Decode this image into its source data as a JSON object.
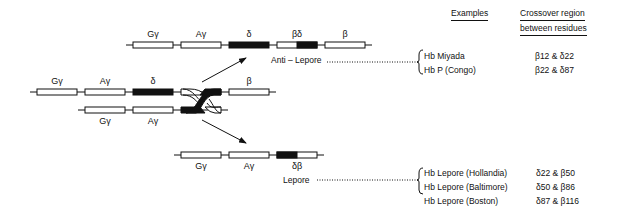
{
  "headers": {
    "examples": "Examples",
    "crossover_line1": "Crossover region",
    "crossover_line2": "between residues"
  },
  "rows": {
    "top": {
      "genes": [
        "Gγ",
        "Aγ",
        "δ",
        "βδ",
        "β"
      ],
      "label": "Anti – Lepore"
    },
    "middle_upper": {
      "genes": [
        "Gγ",
        "Aγ",
        "δ",
        "β"
      ]
    },
    "middle_lower": {
      "genes": [
        "Gγ",
        "Aγ"
      ]
    },
    "bottom": {
      "genes": [
        "Gγ",
        "Aγ",
        "δβ"
      ],
      "label": "Lepore"
    }
  },
  "anti_lepore_examples": [
    {
      "name": "Hb  Miyada",
      "region": "β12 & δ22"
    },
    {
      "name": "Hb  P  (Congo)",
      "region": "β22 & δ87"
    }
  ],
  "lepore_examples": [
    {
      "name": "Hb  Lepore  (Hollandia)",
      "region": "δ22 & β50"
    },
    {
      "name": "Hb  Lepore  (Baltimore)",
      "region": "δ50 & β86"
    },
    {
      "name": "Hb  Lepore  (Boston)",
      "region": "δ87 & β116"
    }
  ],
  "colors": {
    "ink": "#111111",
    "background": "#ffffff"
  }
}
